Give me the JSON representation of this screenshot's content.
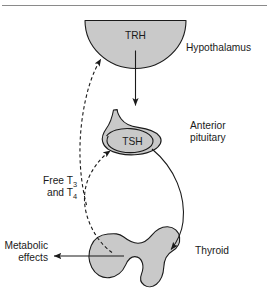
{
  "figure": {
    "top_rule": "horizontal-rule"
  },
  "colors": {
    "organ_fill": "#c9c9c9",
    "outline": "#1a1a1a",
    "rule": "#8a8a8a",
    "background": "#ffffff"
  },
  "organs": [
    {
      "id": "hypothalamus",
      "hormone": "TRH",
      "label": "Hypothalamus"
    },
    {
      "id": "anterior-pituitary",
      "hormone": "TSH",
      "label_line1": "Anterior",
      "label_line2": "pituitary"
    },
    {
      "id": "thyroid",
      "hormone": "",
      "label": "Thyroid"
    }
  ],
  "labels": {
    "hypothalamus": "Hypothalamus",
    "anterior_pituitary_line1": "Anterior",
    "anterior_pituitary_line2": "pituitary",
    "thyroid": "Thyroid",
    "trh": "TRH",
    "tsh": "TSH",
    "free_t_line1_prefix": "Free T",
    "free_t_line1_sub": "3",
    "free_t_line2_prefix": "and T",
    "free_t_line2_sub": "4",
    "metabolic_line1": "Metabolic",
    "metabolic_line2": "effects"
  },
  "arrows": [
    {
      "id": "trh-to-pituitary",
      "style": "solid",
      "from": "hypothalamus",
      "to": "anterior-pituitary"
    },
    {
      "id": "tsh-to-thyroid",
      "style": "solid",
      "from": "anterior-pituitary",
      "to": "thyroid"
    },
    {
      "id": "thyroid-to-metabolic",
      "style": "solid",
      "from": "thyroid",
      "to": "metabolic-effects"
    },
    {
      "id": "feedback-to-pituitary",
      "style": "dashed",
      "from": "thyroid",
      "to": "anterior-pituitary"
    },
    {
      "id": "feedback-to-hypothalamus",
      "style": "dashed",
      "from": "thyroid",
      "to": "hypothalamus"
    }
  ]
}
